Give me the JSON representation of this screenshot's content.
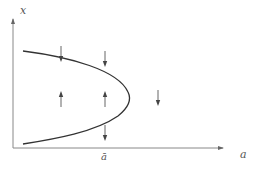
{
  "diagram": {
    "type": "bifurcation-phase-diagram",
    "axes": {
      "y_label": "x",
      "x_label": "a",
      "x_tick_label": "ā"
    },
    "curve": {
      "shape": "saddle-node parabola opening left",
      "tip_label": "ā"
    },
    "arrows": [
      {
        "position": "above upper branch, left",
        "direction": "down"
      },
      {
        "position": "above upper branch, right",
        "direction": "down"
      },
      {
        "position": "inside parabola, left",
        "direction": "up"
      },
      {
        "position": "inside parabola, right",
        "direction": "up"
      },
      {
        "position": "below lower branch",
        "direction": "down"
      },
      {
        "position": "right of tip (a > ā)",
        "direction": "down"
      }
    ],
    "colors": {
      "axis": "#888888",
      "curve": "#333333",
      "arrow": "#444444",
      "label": "#555555"
    }
  }
}
